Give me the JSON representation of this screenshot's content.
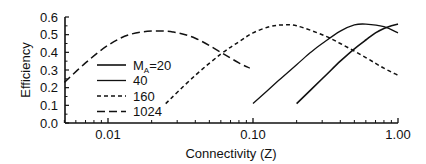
{
  "chart_data": {
    "type": "line",
    "title": "",
    "xlabel": "Connectivity (Z)",
    "ylabel": "Efficiency",
    "xscale": "log",
    "xlim": [
      0.005,
      1.0
    ],
    "ylim": [
      0.0,
      0.6
    ],
    "xticks": [
      0.01,
      0.1,
      1.0
    ],
    "xtick_labels": [
      "0.01",
      "0.10",
      "1.00"
    ],
    "yticks": [
      0.0,
      0.1,
      0.2,
      0.3,
      0.4,
      0.5,
      0.6
    ],
    "ytick_labels": [
      "0.0",
      "0.1",
      "0.2",
      "0.3",
      "0.4",
      "0.5",
      "0.6"
    ],
    "grid": false,
    "legend_position": "inside-left",
    "legend_title_prefix": "M",
    "legend_title_sub": "A",
    "series": [
      {
        "name": "20",
        "legend_label": "=20",
        "style": "solid-thick",
        "x": [
          0.2,
          0.3,
          0.4,
          0.5,
          0.6,
          0.7,
          0.8,
          0.9,
          1.0
        ],
        "y": [
          0.11,
          0.25,
          0.35,
          0.42,
          0.47,
          0.51,
          0.535,
          0.55,
          0.56
        ]
      },
      {
        "name": "40",
        "legend_label": "40",
        "style": "solid",
        "x": [
          0.1,
          0.15,
          0.2,
          0.25,
          0.3,
          0.4,
          0.5,
          0.6,
          0.8,
          1.0
        ],
        "y": [
          0.11,
          0.24,
          0.33,
          0.4,
          0.45,
          0.52,
          0.555,
          0.56,
          0.545,
          0.51
        ]
      },
      {
        "name": "160",
        "legend_label": "160",
        "style": "short-dash",
        "x": [
          0.025,
          0.04,
          0.06,
          0.08,
          0.1,
          0.13,
          0.16,
          0.2,
          0.3,
          0.4,
          0.6,
          0.8,
          1.0
        ],
        "y": [
          0.11,
          0.27,
          0.39,
          0.46,
          0.51,
          0.545,
          0.555,
          0.55,
          0.5,
          0.45,
          0.37,
          0.31,
          0.27
        ]
      },
      {
        "name": "1024",
        "legend_label": "1024",
        "style": "long-dash",
        "x": [
          0.005,
          0.007,
          0.01,
          0.014,
          0.02,
          0.028,
          0.04,
          0.06,
          0.08,
          0.095
        ],
        "y": [
          0.23,
          0.34,
          0.44,
          0.5,
          0.52,
          0.515,
          0.48,
          0.4,
          0.34,
          0.31
        ]
      }
    ]
  }
}
